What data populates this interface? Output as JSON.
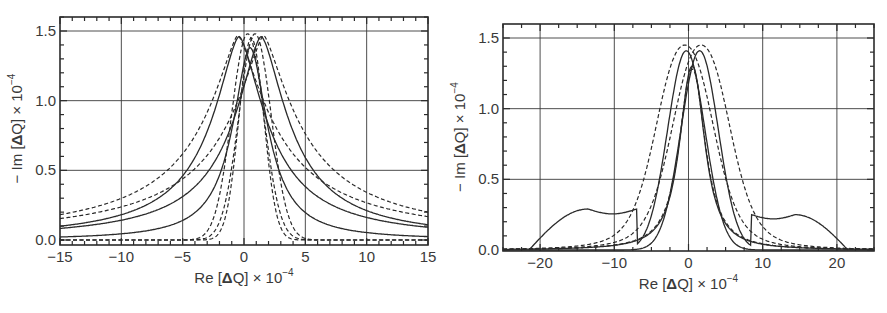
{
  "chart_data": [
    {
      "id": "left",
      "type": "line",
      "title": "",
      "xlabel": "Re [ΔQ] × 10⁻⁴",
      "ylabel": "− Im [ΔQ] × 10⁻⁴",
      "xlabel_parts": {
        "pre": "Re [",
        "bold": "Δ",
        "mid": "Q] × 10",
        "sup": "−4"
      },
      "ylabel_parts": {
        "pre": "− Im [",
        "bold": "Δ",
        "mid": "Q] × 10",
        "sup": "−4"
      },
      "xlim": [
        -15,
        15
      ],
      "ylim": [
        0,
        1.6
      ],
      "xticks": [
        -15,
        -10,
        -5,
        0,
        5,
        10,
        15
      ],
      "xtick_labels": [
        "−15",
        "−10",
        "−5",
        "0",
        "5",
        "10",
        "15"
      ],
      "yticks": [
        0.0,
        0.5,
        1.0,
        1.5
      ],
      "ytick_labels": [
        "0.0",
        "0.5",
        "1.0",
        "1.5"
      ],
      "grid": true,
      "legend": null,
      "frame_px": {
        "x0": 60,
        "x1": 428,
        "y0": 17,
        "y1": 245,
        "yzero": 240,
        "yone5": 31
      },
      "series": [
        {
          "name": "wide solid (left-shifted peak)",
          "style": "solid",
          "center": -0.4,
          "peak": 1.46,
          "width": 3.4,
          "shape": "lorentz",
          "power": 1.6
        },
        {
          "name": "wide solid (right-shifted peak)",
          "style": "solid",
          "center": 1.4,
          "peak": 1.46,
          "width": 3.4,
          "shape": "lorentz",
          "power": 1.6
        },
        {
          "name": "wide dashed (left)",
          "style": "dashed",
          "center": -0.5,
          "peak": 1.47,
          "width": 4.3,
          "shape": "lorentz",
          "power": 1.4
        },
        {
          "name": "wide dashed (right)",
          "style": "dashed",
          "center": 1.6,
          "peak": 1.47,
          "width": 4.3,
          "shape": "lorentz",
          "power": 1.4
        },
        {
          "name": "narrow solid",
          "style": "solid",
          "center": 0.5,
          "peak": 1.38,
          "width": 2.1,
          "shape": "lorentz",
          "power": 1.9
        },
        {
          "name": "narrow dashed A",
          "style": "dashed",
          "center": 0.3,
          "peak": 1.48,
          "width": 2.2,
          "shape": "gauss"
        },
        {
          "name": "narrow dashed B",
          "style": "dashed",
          "center": 0.9,
          "peak": 1.48,
          "width": 2.2,
          "shape": "gauss"
        },
        {
          "name": "narrow dashed C",
          "style": "dashed",
          "center": 0.6,
          "peak": 1.45,
          "width": 1.7,
          "shape": "gauss"
        }
      ]
    },
    {
      "id": "right",
      "type": "line",
      "title": "",
      "xlabel": "Re [ΔQ] × 10⁻⁴",
      "ylabel": "− Im [ΔQ] × 10⁻⁴",
      "xlabel_parts": {
        "pre": "Re [",
        "bold": "Δ",
        "mid": "Q] × 10",
        "sup": "−4"
      },
      "ylabel_parts": {
        "pre": "− Im [",
        "bold": "Δ",
        "mid": "Q] × 10",
        "sup": "−4"
      },
      "xlim": [
        -25,
        25
      ],
      "ylim": [
        0,
        1.6
      ],
      "xticks": [
        -20,
        -10,
        0,
        10,
        20
      ],
      "xtick_labels": [
        "−20",
        "−10",
        "0",
        "10",
        "20"
      ],
      "yticks": [
        0.0,
        0.5,
        1.0,
        1.5
      ],
      "ytick_labels": [
        "0.0",
        "0.5",
        "1.0",
        "1.5"
      ],
      "grid": true,
      "legend": null,
      "frame_px": {
        "x0": 503,
        "x1": 874,
        "y0": 24,
        "y1": 251,
        "yzero": 250,
        "yone5": 38
      },
      "series": [
        {
          "name": "solid with side shoulders (left)",
          "style": "solid",
          "center": -0.3,
          "peak": 1.41,
          "width": 4.2,
          "shape": "gauss",
          "shoulder": {
            "side": -1,
            "level": 0.29,
            "start": -21.5,
            "end": -7
          }
        },
        {
          "name": "solid with side shoulders (right)",
          "style": "solid",
          "center": 1.5,
          "peak": 1.41,
          "width": 4.2,
          "shape": "gauss",
          "shoulder": {
            "side": 1,
            "level": 0.25,
            "start": 8.5,
            "end": 21.5
          }
        },
        {
          "name": "dashed envelope (left)",
          "style": "dashed",
          "center": -0.5,
          "peak": 1.45,
          "width": 5.0,
          "shape": "gauss_tail"
        },
        {
          "name": "dashed envelope (right)",
          "style": "dashed",
          "center": 1.7,
          "peak": 1.45,
          "width": 5.0,
          "shape": "gauss_tail"
        },
        {
          "name": "narrow solid",
          "style": "solid",
          "center": 0.5,
          "peak": 1.3,
          "width": 2.4,
          "shape": "lorentz",
          "power": 2.2
        },
        {
          "name": "narrow dashed",
          "style": "dashed",
          "center": 0.5,
          "peak": 1.28,
          "width": 2.5,
          "shape": "lorentz",
          "power": 2.2
        }
      ]
    }
  ]
}
